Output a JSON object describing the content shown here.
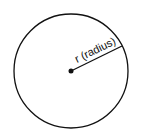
{
  "diagram": {
    "title": "",
    "shape": "circle",
    "center": {
      "x": 71,
      "y": 71
    },
    "radius_px": 57,
    "radius_label": "r (radius)",
    "colors": {
      "stroke": "#111111",
      "background": "#ffffff"
    }
  }
}
